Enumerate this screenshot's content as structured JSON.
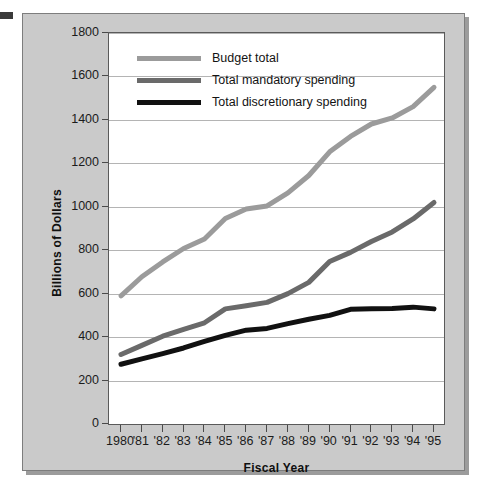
{
  "chart_data": {
    "type": "line",
    "title": "",
    "xlabel": "Fiscal Year",
    "ylabel": "Billions of Dollars",
    "categories": [
      "1980",
      "'81",
      "'82",
      "'83",
      "'84",
      "'85",
      "'86",
      "'87",
      "'88",
      "'89",
      "'90",
      "'91",
      "'92",
      "'93",
      "'94",
      "'95"
    ],
    "x_values": [
      1980,
      1981,
      1982,
      1983,
      1984,
      1985,
      1986,
      1987,
      1988,
      1989,
      1990,
      1991,
      1992,
      1993,
      1994,
      1995
    ],
    "ylim": [
      0,
      1800
    ],
    "ytick_labels": [
      "1800",
      "1600",
      "1400",
      "1200",
      "1000",
      "800",
      "600",
      "400",
      "200",
      "0"
    ],
    "ytick_values": [
      1800,
      1600,
      1400,
      1200,
      1000,
      800,
      600,
      400,
      200,
      0
    ],
    "grid": true,
    "legend_position": "top-left",
    "series": [
      {
        "name": "Budget total",
        "color": "#9b9b9b",
        "values": [
          590,
          678,
          746,
          808,
          852,
          946,
          990,
          1004,
          1064,
          1144,
          1253,
          1324,
          1381,
          1409,
          1461,
          1550
        ]
      },
      {
        "name": "Total mandatory spending",
        "color": "#6a6a6a",
        "values": [
          320,
          362,
          404,
          436,
          466,
          530,
          544,
          560,
          600,
          652,
          748,
          790,
          840,
          884,
          944,
          1020
        ]
      },
      {
        "name": "Total discretionary spending",
        "color": "#111111",
        "values": [
          275,
          300,
          324,
          350,
          380,
          408,
          432,
          440,
          462,
          482,
          500,
          528,
          530,
          532,
          538,
          530
        ]
      }
    ]
  },
  "legend": {
    "items": [
      {
        "label": "Budget total",
        "color": "#9b9b9b"
      },
      {
        "label": "Total mandatory spending",
        "color": "#6a6a6a"
      },
      {
        "label": "Total discretionary spending",
        "color": "#111111"
      }
    ]
  },
  "axes": {
    "y_title": "Billions of Dollars",
    "x_title": "Fiscal Year"
  }
}
